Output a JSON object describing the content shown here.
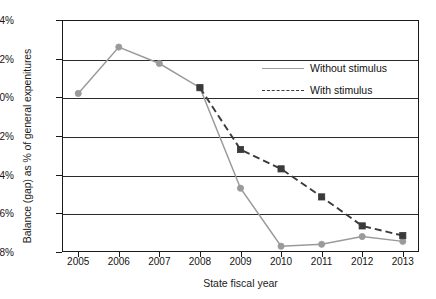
{
  "chart_data": {
    "type": "line",
    "title": "",
    "xlabel": "State fiscal year",
    "ylabel": "Balance (gap) as % of general expenitures",
    "categories": [
      "2005",
      "2006",
      "2007",
      "2008",
      "2009",
      "2010",
      "2011",
      "2012",
      "2013"
    ],
    "x": [
      2005,
      2006,
      2007,
      2008,
      2009,
      2010,
      2011,
      2012,
      2013
    ],
    "ylim": [
      -8,
      4
    ],
    "xlim": [
      2004.6,
      2013.4
    ],
    "y_ticks": [
      4,
      2,
      0,
      -2,
      -4,
      -6,
      -8
    ],
    "y_tick_labels": [
      "4%",
      "2%",
      "0%",
      "-2%",
      "-4%",
      "-6%",
      "-8%"
    ],
    "x_tick_labels": [
      "2005",
      "2006",
      "2007",
      "2008",
      "2009",
      "2010",
      "2011",
      "2012",
      "2013"
    ],
    "grid": "horizontal",
    "legend_position": "upper-right-inside",
    "series": [
      {
        "name": "Without stimulus",
        "style": "solid",
        "marker": "circle",
        "color": "#9a9a9a",
        "x": [
          2005,
          2006,
          2007,
          2008,
          2009,
          2010,
          2011,
          2012,
          2013
        ],
        "values": [
          0.2,
          2.6,
          1.75,
          0.5,
          -4.7,
          -7.7,
          -7.6,
          -7.2,
          -7.45
        ]
      },
      {
        "name": "With stimulus",
        "style": "dashed",
        "marker": "square",
        "color": "#3a3a3a",
        "x": [
          2008,
          2009,
          2010,
          2011,
          2012,
          2013
        ],
        "values": [
          0.5,
          -2.7,
          -3.7,
          -5.15,
          -6.65,
          -7.15
        ]
      }
    ]
  },
  "legend": {
    "entries": [
      {
        "label": "Without stimulus"
      },
      {
        "label": "With stimulus"
      }
    ]
  },
  "axes": {
    "y_title": "Balance (gap) as % of general expenitures",
    "x_title": "State fiscal year"
  },
  "colors": {
    "without_stimulus": "#9a9a9a",
    "with_stimulus": "#3a3a3a",
    "axis": "#1a1a1a",
    "background": "#ffffff"
  }
}
